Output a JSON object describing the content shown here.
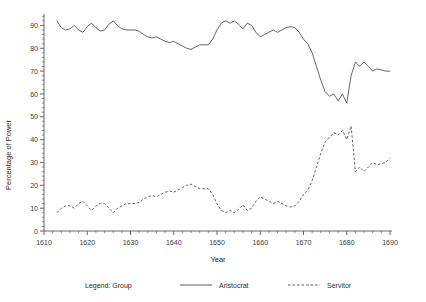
{
  "chart_data": {
    "type": "line",
    "title": "",
    "xlabel": "Year",
    "ylabel": "Percentage of Power",
    "xlim": [
      1610,
      1690
    ],
    "ylim": [
      0,
      95
    ],
    "grid": false,
    "legend_position": "bottom",
    "legend_title": "Legend: Group",
    "x_ticks": [
      1610,
      1620,
      1630,
      1640,
      1650,
      1660,
      1670,
      1680,
      1690
    ],
    "x_tick_labels": [
      "1610",
      "1620",
      "1630",
      "1640",
      "1650",
      "1660",
      "1670",
      "1680",
      "1690"
    ],
    "y_ticks": [
      0,
      10,
      20,
      30,
      40,
      50,
      60,
      70,
      80,
      90
    ],
    "y_tick_labels": [
      "0",
      "10",
      "20",
      "30",
      "40",
      "50",
      "60",
      "70",
      "80",
      "90"
    ],
    "x": [
      1613,
      1614,
      1615,
      1616,
      1617,
      1618,
      1619,
      1620,
      1621,
      1622,
      1623,
      1624,
      1625,
      1626,
      1627,
      1628,
      1629,
      1630,
      1631,
      1632,
      1633,
      1634,
      1635,
      1636,
      1637,
      1638,
      1639,
      1640,
      1641,
      1642,
      1643,
      1644,
      1645,
      1646,
      1647,
      1648,
      1649,
      1650,
      1651,
      1652,
      1653,
      1654,
      1655,
      1656,
      1657,
      1658,
      1659,
      1660,
      1661,
      1662,
      1663,
      1664,
      1665,
      1666,
      1667,
      1668,
      1669,
      1670,
      1671,
      1672,
      1673,
      1674,
      1675,
      1676,
      1677,
      1678,
      1679,
      1680,
      1681,
      1682,
      1683,
      1684,
      1685,
      1686,
      1687,
      1688,
      1689,
      1690
    ],
    "series": [
      {
        "name": "Aristocrat",
        "style": "solid",
        "color": "#4a4a4a",
        "values": [
          92,
          89,
          88,
          88.5,
          90,
          88,
          87,
          89.5,
          91,
          89,
          87.5,
          88,
          90.5,
          92,
          90,
          88.5,
          88,
          88,
          88,
          87.5,
          86,
          85,
          84.5,
          85,
          84,
          83,
          82.5,
          83,
          82,
          81,
          80,
          79.5,
          80.5,
          81.5,
          81.5,
          81.5,
          84,
          88,
          91,
          92,
          91,
          92,
          90.5,
          88.5,
          91,
          90,
          87,
          85,
          86,
          87,
          88,
          87,
          88,
          89,
          89.5,
          89,
          87,
          84,
          82,
          78,
          72,
          66,
          61,
          59,
          60,
          57,
          60,
          56,
          68,
          74,
          72,
          74,
          72,
          70,
          71,
          70.5,
          70,
          70
        ]
      },
      {
        "name": "Servitor",
        "style": "dashed",
        "color": "#4a4a4a",
        "values": [
          8,
          10,
          11,
          11,
          10,
          12,
          13,
          11,
          9,
          11,
          12,
          12,
          10,
          8,
          10,
          11,
          12,
          12,
          12,
          12.5,
          14,
          15,
          15.5,
          15,
          16,
          17,
          17.5,
          17,
          18,
          19,
          20,
          20.5,
          19.5,
          18.5,
          18.5,
          18.5,
          16,
          12,
          9,
          8,
          9,
          8,
          9.5,
          11.5,
          9,
          10,
          13,
          15,
          14,
          13,
          12,
          13,
          12,
          11,
          10.5,
          11,
          13,
          16,
          18,
          22,
          28,
          34,
          39,
          41,
          43,
          42,
          44,
          40,
          46,
          26,
          28,
          26,
          28,
          30,
          29,
          29.5,
          30,
          32
        ]
      }
    ],
    "annotations": []
  },
  "legend": {
    "title": "Legend: Group",
    "items": [
      {
        "label": "Aristocrat",
        "style": "solid"
      },
      {
        "label": "Servitor",
        "style": "dashed"
      }
    ]
  },
  "axes": {
    "x_title": "Year",
    "y_title": "Percentage of Power"
  }
}
